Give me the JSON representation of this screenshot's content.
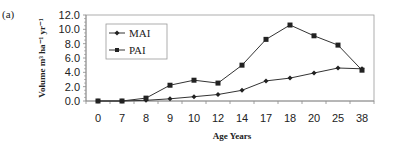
{
  "panel_label": "(a)",
  "chart_data": {
    "type": "line",
    "title": "",
    "xlabel": "Age Years",
    "ylabel": "Volume m³ ha⁻¹ yr⁻¹",
    "categories": [
      "0",
      "7",
      "8",
      "9",
      "10",
      "12",
      "14",
      "17",
      "18",
      "20",
      "25",
      "38"
    ],
    "series": [
      {
        "name": "MAI",
        "marker": "diamond",
        "values": [
          0.0,
          0.0,
          0.1,
          0.3,
          0.6,
          0.9,
          1.5,
          2.8,
          3.2,
          3.9,
          4.6,
          4.5
        ]
      },
      {
        "name": "PAI",
        "marker": "square",
        "values": [
          0.0,
          0.0,
          0.4,
          2.2,
          2.9,
          2.5,
          5.0,
          8.6,
          10.6,
          9.1,
          7.8,
          4.3
        ]
      }
    ],
    "yticks": [
      "0.0",
      "2.0",
      "4.0",
      "6.0",
      "8.0",
      "10.0",
      "12.0"
    ],
    "ylim": [
      0,
      12
    ],
    "grid": false,
    "legend_position": "upper left inside"
  },
  "colors": {
    "line": "#333333",
    "axis": "#888888",
    "frame": "#999999",
    "text": "#222222"
  }
}
